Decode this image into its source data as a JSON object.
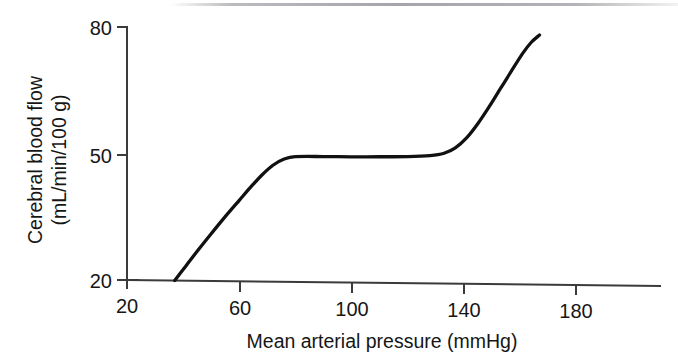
{
  "chart_data": {
    "type": "line",
    "title": "",
    "subtitle": "",
    "xlabel": "Mean arterial pressure (mmHg)",
    "ylabel_line1": "Cerebral blood flow",
    "ylabel_line2": "(mL/min/100 g)",
    "ylabel": "Cerebral blood flow (mL/min/100 g)",
    "xlim": [
      20,
      200
    ],
    "ylim": [
      20,
      80
    ],
    "xticks": [
      20,
      60,
      100,
      140,
      180
    ],
    "xtick_labels": [
      "20",
      "60",
      "100",
      "140",
      "180"
    ],
    "yticks": [
      20,
      50,
      80
    ],
    "ytick_labels": [
      "20",
      "50",
      "80"
    ],
    "grid": false,
    "legend": false,
    "legend_position": "none",
    "series": [
      {
        "name": "Cerebral blood flow autoregulation",
        "color": "#111111",
        "x": [
          37,
          41,
          45,
          50,
          55,
          60,
          64,
          68,
          72,
          76,
          80,
          90,
          100,
          110,
          120,
          128,
          133,
          137,
          141,
          145,
          149,
          153,
          157,
          161,
          164,
          167
        ],
        "y": [
          20.0,
          23.5,
          27.0,
          31.2,
          35.3,
          39.2,
          42.3,
          45.2,
          47.6,
          49.1,
          49.7,
          49.8,
          49.8,
          49.9,
          50.0,
          50.3,
          50.9,
          52.2,
          54.6,
          58.0,
          62.0,
          66.3,
          70.6,
          74.8,
          77.4,
          79.2
        ]
      }
    ],
    "annotations": [
      {
        "text": "autoregulatory plateau",
        "x_range": [
          76,
          133
        ],
        "y_value": 50
      }
    ]
  },
  "axes": {
    "x_axis_name": "x-axis",
    "y_axis_name": "y-axis"
  }
}
